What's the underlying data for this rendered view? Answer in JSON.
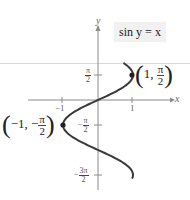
{
  "chart_data": {
    "type": "line",
    "title": "",
    "equation": "sin y = x",
    "xlabel": "x",
    "ylabel": "y",
    "xlim": [
      -1.4,
      1.4
    ],
    "ylim": [
      -5.0,
      2.4
    ],
    "grid": false,
    "x_ticks": [
      {
        "value": -1,
        "label": "−1"
      },
      {
        "value": 1,
        "label": "1"
      }
    ],
    "y_ticks": [
      {
        "value": 1.5708,
        "label_num": "π",
        "label_den": "2",
        "sign": ""
      },
      {
        "value": -1.5708,
        "label_num": "π",
        "label_den": "2",
        "sign": "−"
      },
      {
        "value": -4.7124,
        "label_num": "3π",
        "label_den": "2",
        "sign": "−"
      }
    ],
    "series": [
      {
        "name": "sin y = x",
        "description": "x = sin(y), y from -4.9 to 2.3",
        "points": [
          {
            "x": 0.746,
            "y": 2.3
          },
          {
            "x": 0.909,
            "y": 2.0
          },
          {
            "x": 1.0,
            "y": 1.5708
          },
          {
            "x": 0.841,
            "y": 1.0
          },
          {
            "x": 0.479,
            "y": 0.5
          },
          {
            "x": 0.0,
            "y": 0.0
          },
          {
            "x": -0.479,
            "y": -0.5
          },
          {
            "x": -0.841,
            "y": -1.0
          },
          {
            "x": -1.0,
            "y": -1.5708
          },
          {
            "x": -0.909,
            "y": -2.0
          },
          {
            "x": -0.598,
            "y": -2.5
          },
          {
            "x": 0.0,
            "y": -3.1416
          },
          {
            "x": 0.351,
            "y": -3.5
          },
          {
            "x": 0.757,
            "y": -4.0
          },
          {
            "x": 1.0,
            "y": -4.7124
          },
          {
            "x": 0.983,
            "y": -4.9
          }
        ]
      }
    ],
    "annotations": [
      {
        "point": [
          1,
          1.5708
        ],
        "label": "(1, π/2)"
      },
      {
        "point": [
          -1,
          -1.5708
        ],
        "label": "(−1, −π/2)"
      }
    ]
  },
  "labels": {
    "equation": "sin y = x",
    "x_axis": "x",
    "y_axis": "y",
    "tick_x_neg1": "−1",
    "tick_x_1": "1",
    "tick_pi": "π",
    "tick_two": "2",
    "tick_3pi": "3π",
    "minus": "−",
    "pt1_prefix": "1,",
    "pt1_num": "π",
    "pt1_den": "2",
    "pt2_prefix": "−1, −",
    "pt2_num": "π",
    "pt2_den": "2",
    "lparen": "(",
    "rparen": ")"
  },
  "colors": {
    "curve": "#3a3a3a",
    "axis": "#888888",
    "equation_box": "#f1f1f1"
  }
}
